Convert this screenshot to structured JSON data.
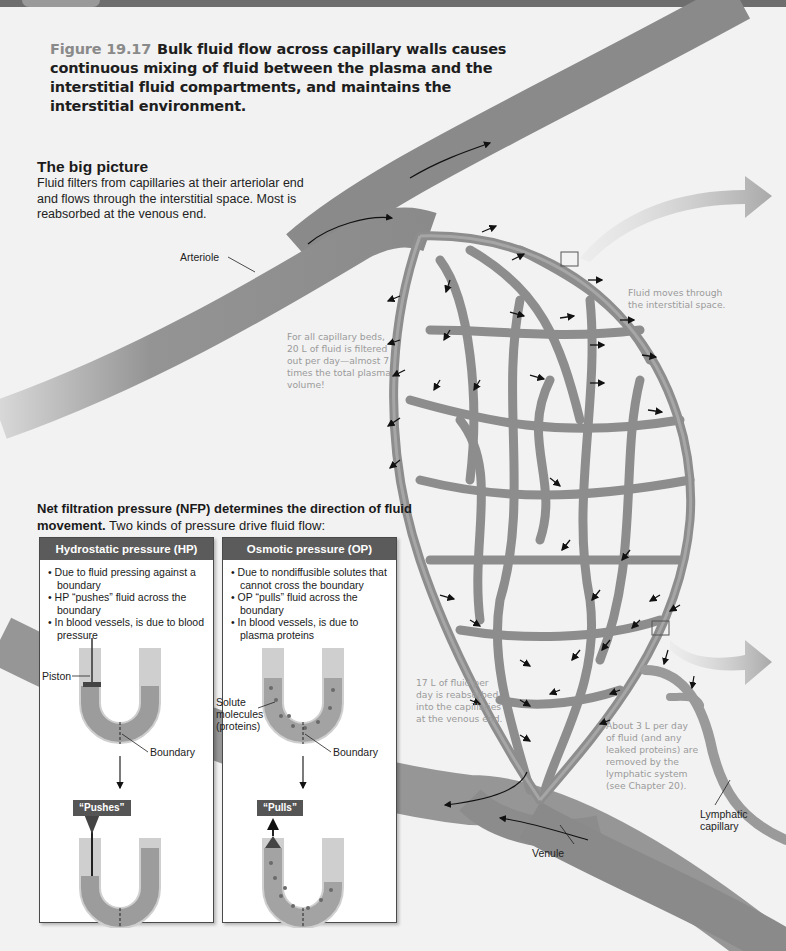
{
  "figure": {
    "number": "Figure 19.17",
    "caption": "Bulk fluid flow across capillary walls causes continuous mixing of fluid between the plasma and the interstitial fluid compartments, and maintains the interstitial environment."
  },
  "big_picture": {
    "heading": "The big picture",
    "text": "Fluid filters from capillaries at their arteriolar end and flows through the interstitial space. Most is reabsorbed at the venous end."
  },
  "labels": {
    "arteriole": "Arteriole",
    "venule": "Venule",
    "lymphatic_capillary_line1": "Lymphatic",
    "lymphatic_capillary_line2": "capillary"
  },
  "notes": {
    "filtered": [
      "For all capillary beds,",
      "20 L of fluid is filtered",
      "out per day—almost 7",
      "times the total plasma",
      "volume!"
    ],
    "interstitial": [
      "Fluid moves through",
      "the interstitial space."
    ],
    "reabsorbed": [
      "17 L of fluid per",
      "day is reabsorbed",
      "into the capillaries",
      "at the venous end."
    ],
    "lymphatic": [
      "About 3 L per day",
      "of fluid (and any",
      "leaked proteins) are",
      "removed by the",
      "lymphatic system",
      "(see Chapter 20)."
    ]
  },
  "nfp": {
    "bold": "Net filtration pressure (NFP) determines the direction of fluid movement.",
    "rest": " Two kinds of pressure drive fluid flow:"
  },
  "panels": {
    "hydrostatic": {
      "title": "Hydrostatic pressure (HP)",
      "bullets": [
        "Due to fluid pressing against a boundary",
        "HP “pushes” fluid across the boundary",
        "In blood vessels, is due to blood pressure"
      ],
      "piston_label": "Piston",
      "boundary_label": "Boundary",
      "action_tag": "“Pushes”"
    },
    "osmotic": {
      "title": "Osmotic pressure (OP)",
      "bullets": [
        "Due to nondiffusible solutes that cannot cross the boundary",
        "OP “pulls” fluid across the boundary",
        "In blood vessels, is due to plasma proteins"
      ],
      "solute_label_1": "Solute",
      "solute_label_2": "molecules",
      "solute_label_3": "(proteins)",
      "boundary_label": "Boundary",
      "action_tag": "“Pulls”"
    }
  },
  "colors": {
    "background": "#f2f2f2",
    "vessel": "#8f8f8f",
    "vessel_dark": "#6f6f6f",
    "panel_header": "#5b5b5b",
    "note_text": "#9a9a9a",
    "flow_arrow": "#b5b5b5"
  }
}
